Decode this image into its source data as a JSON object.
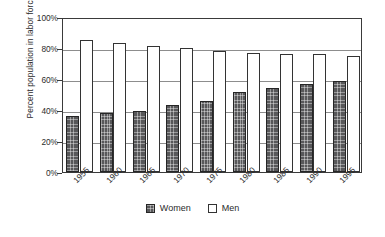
{
  "chart_data": {
    "type": "bar",
    "title": "",
    "subtitle": "",
    "xlabel": "",
    "ylabel": "Percent population in labor force",
    "categories": [
      "1955",
      "1960",
      "1965",
      "1970",
      "1975",
      "1980",
      "1985",
      "1990",
      "1995"
    ],
    "series": [
      {
        "name": "Women",
        "color": "#58585a",
        "fill": "dark-hatched",
        "values": [
          36,
          38,
          39.5,
          43,
          46,
          51.5,
          54,
          57,
          58.5
        ]
      },
      {
        "name": "Men",
        "color": "#ffffff",
        "fill": "white-outlined",
        "values": [
          85,
          83.5,
          81,
          80,
          78,
          77,
          76,
          76,
          75
        ]
      }
    ],
    "ylim": [
      0,
      100
    ],
    "yticks": [
      0,
      20,
      40,
      60,
      80,
      100
    ],
    "ytick_labels": [
      "0%",
      "20%",
      "40%",
      "60%",
      "80%",
      "100%"
    ],
    "grid": true,
    "grid_axis": "y",
    "legend_position": "bottom-center",
    "value_unit": "%"
  },
  "axis": {
    "y_title": "Percent population in labor force"
  },
  "legend": {
    "entries": [
      {
        "label": "Women"
      },
      {
        "label": "Men"
      }
    ]
  }
}
